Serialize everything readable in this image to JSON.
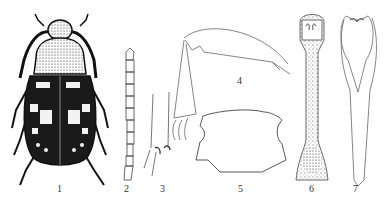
{
  "figure": {
    "type": "scientific illustration plate",
    "panels": [
      {
        "label": "1",
        "subject": "beetle habitus, dorsal view"
      },
      {
        "label": "2",
        "subject": "antenna"
      },
      {
        "label": "3",
        "subject": "leg segment detail"
      },
      {
        "label": "4",
        "subject": "leg / femur"
      },
      {
        "label": "5",
        "subject": "pronotum outline"
      },
      {
        "label": "6",
        "subject": "aedeagus (stippled)"
      },
      {
        "label": "7",
        "subject": "paramere outline"
      }
    ]
  }
}
